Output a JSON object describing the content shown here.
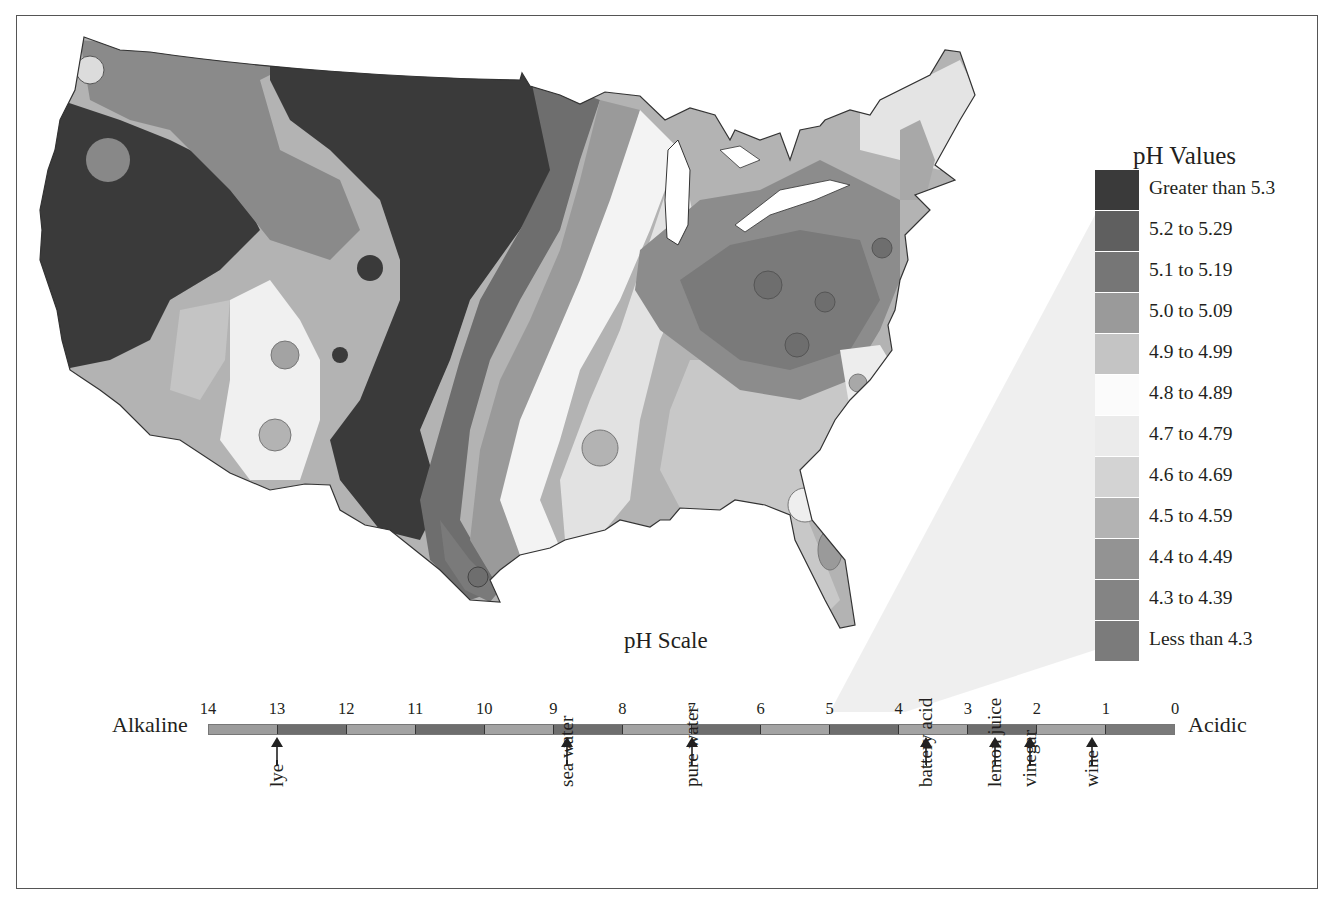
{
  "header": {
    "cut_title": "pH of Precipitation by Location in the Continental U.S."
  },
  "map": {
    "description": "Contoured choropleth map of the continental United States showing precipitation pH values"
  },
  "legend": {
    "title": "pH Values",
    "items": [
      {
        "label": "Greater than 5.3",
        "color": "#3a3a3a"
      },
      {
        "label": "5.2 to 5.29",
        "color": "#5f5f5f"
      },
      {
        "label": "5.1 to 5.19",
        "color": "#767676"
      },
      {
        "label": "5.0 to 5.09",
        "color": "#9a9a9a"
      },
      {
        "label": "4.9 to 4.99",
        "color": "#c4c4c4"
      },
      {
        "label": "4.8 to 4.89",
        "color": "#fbfbfb"
      },
      {
        "label": "4.7 to 4.79",
        "color": "#ebebeb"
      },
      {
        "label": "4.6 to 4.69",
        "color": "#d3d3d3"
      },
      {
        "label": "4.5 to 4.59",
        "color": "#b3b3b3"
      },
      {
        "label": "4.4 to 4.49",
        "color": "#939393"
      },
      {
        "label": "4.3 to 4.39",
        "color": "#848484"
      },
      {
        "label": "Less than 4.3",
        "color": "#7b7b7b"
      }
    ]
  },
  "scale": {
    "title": "pH Scale",
    "left_label": "Alkaline",
    "right_label": "Acidic",
    "ticks": [
      "14",
      "13",
      "12",
      "11",
      "10",
      "9",
      "8",
      "7",
      "6",
      "5",
      "4",
      "3",
      "2",
      "1",
      "0"
    ],
    "segment_colors": [
      "#9c9c9c",
      "#6e6e6e",
      "#a3a3a3",
      "#6e6e6e",
      "#a3a3a3",
      "#6e6e6e",
      "#a3a3a3",
      "#6e6e6e",
      "#a3a3a3",
      "#6e6e6e",
      "#a3a3a3",
      "#6e6e6e",
      "#a3a3a3",
      "#7a7a7a"
    ],
    "substances": [
      {
        "label": "lye",
        "ph": 13.0
      },
      {
        "label": "sea water",
        "ph": 8.8
      },
      {
        "label": "pure water",
        "ph": 7.0
      },
      {
        "label": "battery acid",
        "ph": 3.6
      },
      {
        "label": "lemon juice",
        "ph": 2.6
      },
      {
        "label": "vinegar",
        "ph": 2.1
      },
      {
        "label": "wine",
        "ph": 1.2
      }
    ]
  }
}
